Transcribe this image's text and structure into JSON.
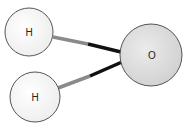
{
  "diagram": {
    "atoms": [
      {
        "id": "h1",
        "label": "H",
        "cx": 29,
        "cy": 32,
        "r": 24,
        "fill": "#f4f4f4"
      },
      {
        "id": "h2",
        "label": "H",
        "cx": 35,
        "cy": 97,
        "r": 25,
        "fill": "#f4f4f4"
      },
      {
        "id": "o",
        "label": "O",
        "cx": 151,
        "cy": 55,
        "r": 31,
        "fill": "#dcdcdc"
      }
    ],
    "bonds": [
      {
        "from": "h1",
        "to": "o",
        "h_color": "#8a8a8a",
        "o_color": "#111111"
      },
      {
        "from": "h2",
        "to": "o",
        "h_color": "#8a8a8a",
        "o_color": "#111111"
      }
    ],
    "stroke_color": "#555555"
  }
}
